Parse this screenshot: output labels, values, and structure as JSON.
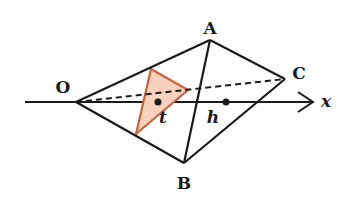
{
  "diagram": {
    "colors": {
      "line": "#1a1a1a",
      "section_stroke": "#c8643c",
      "section_fill": "#f6d2bd"
    },
    "vertices": {
      "O": {
        "label": "O",
        "x": 76,
        "y": 102
      },
      "A": {
        "label": "A",
        "x": 210,
        "y": 40
      },
      "B": {
        "label": "B",
        "x": 184,
        "y": 163
      },
      "C": {
        "label": "C",
        "x": 285,
        "y": 79
      }
    },
    "axis": {
      "label": "x",
      "y": 102,
      "x_start": 25,
      "x_end": 314
    },
    "points": {
      "t": {
        "label": "t",
        "x": 158,
        "y": 102
      },
      "h": {
        "label": "h",
        "x": 226,
        "y": 102
      }
    },
    "section_triangle": [
      [
        151,
        69
      ],
      [
        188,
        90
      ],
      [
        136,
        134
      ]
    ],
    "hidden_edges": [
      "OC"
    ]
  }
}
